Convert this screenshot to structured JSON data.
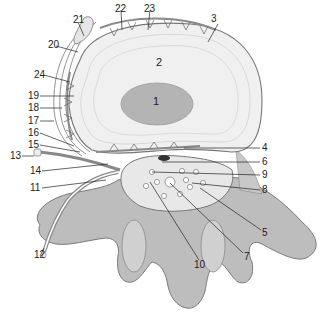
{
  "diagram": {
    "type": "anatomical-illustration",
    "labels": [
      {
        "id": "1",
        "x": 157,
        "y": 100
      },
      {
        "id": "2",
        "x": 160,
        "y": 61
      },
      {
        "id": "3",
        "x": 214,
        "y": 18
      },
      {
        "id": "4",
        "x": 264,
        "y": 144
      },
      {
        "id": "5",
        "x": 264,
        "y": 229
      },
      {
        "id": "6",
        "x": 264,
        "y": 158
      },
      {
        "id": "7",
        "x": 246,
        "y": 252
      },
      {
        "id": "8",
        "x": 264,
        "y": 186
      },
      {
        "id": "9",
        "x": 264,
        "y": 171
      },
      {
        "id": "10",
        "x": 196,
        "y": 262
      },
      {
        "id": "11",
        "x": 30,
        "y": 184
      },
      {
        "id": "12",
        "x": 36,
        "y": 250
      },
      {
        "id": "13",
        "x": 11,
        "y": 152
      },
      {
        "id": "14",
        "x": 30,
        "y": 167
      },
      {
        "id": "15",
        "x": 29,
        "y": 141
      },
      {
        "id": "16",
        "x": 29,
        "y": 129
      },
      {
        "id": "17",
        "x": 29,
        "y": 117
      },
      {
        "id": "18",
        "x": 29,
        "y": 104
      },
      {
        "id": "19",
        "x": 29,
        "y": 92
      },
      {
        "id": "20",
        "x": 48,
        "y": 40
      },
      {
        "id": "21",
        "x": 73,
        "y": 16
      },
      {
        "id": "22",
        "x": 116,
        "y": 5
      },
      {
        "id": "23",
        "x": 145,
        "y": 5
      },
      {
        "id": "24",
        "x": 34,
        "y": 71
      }
    ]
  },
  "colors": {
    "background": "#ffffff",
    "bone": "#b8b8b8",
    "disc_outer": "#ececec",
    "nucleus": "#b0b0b0",
    "vessel": "#8c8c8c",
    "line": "#222222"
  }
}
